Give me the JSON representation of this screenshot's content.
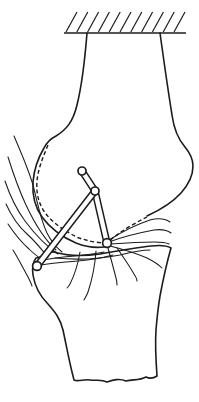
{
  "figure": {
    "colors": {
      "ink": "#1c1c1c",
      "background": "#ffffff"
    },
    "fixed_support": {
      "baseline": {
        "x1": 64,
        "y1": 33,
        "x2": 186,
        "y2": 33
      },
      "hatch": {
        "count": 11,
        "x_start": 66,
        "spacing": 10.8,
        "y_bottom": 32,
        "y_top": 12,
        "dx": 11
      }
    },
    "linkage": {
      "pins": [
        {
          "id": "pin-A-femoral",
          "x": 82,
          "y": 171,
          "r": 4.0
        },
        {
          "id": "pin-B-femoral",
          "x": 95,
          "y": 191,
          "r": 4.0
        },
        {
          "id": "pin-C-tibial",
          "x": 37,
          "y": 266,
          "r": 4.4
        },
        {
          "id": "pin-D-tibial",
          "x": 107,
          "y": 243,
          "r": 4.4
        }
      ],
      "rods": [
        {
          "id": "rod-femoral-link",
          "from": "pin-A-femoral",
          "to": "pin-B-femoral"
        },
        {
          "id": "rod-posterior-cruciate",
          "from": "pin-B-femoral",
          "to": "pin-D-tibial"
        },
        {
          "id": "rod-anterior-cruciate",
          "from": "pin-C-tibial",
          "to": "pin-B-femoral"
        }
      ]
    }
  }
}
